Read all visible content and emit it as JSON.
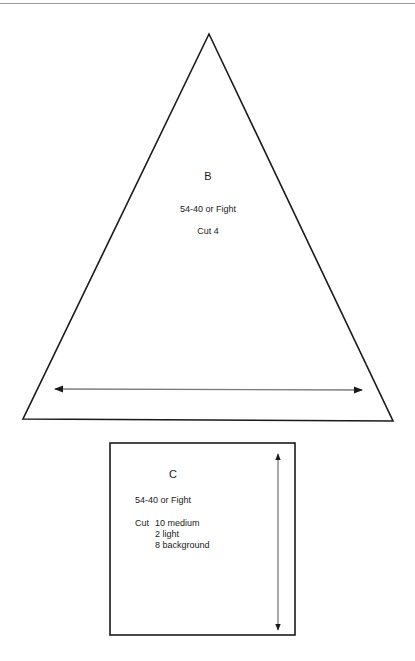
{
  "page": {
    "colors": {
      "outline": "#1a1a1a",
      "grainline": "#7a7a7a",
      "background": "#ffffff"
    }
  },
  "template_b": {
    "letter": "B",
    "block_name": "54-40 or Fight",
    "cut_instruction": "Cut 4",
    "shape": "triangle",
    "grainline": "horizontal-double-arrow"
  },
  "template_c": {
    "letter": "C",
    "block_name": "54-40 or Fight",
    "cut_label": "Cut",
    "cut_items": [
      "10 medium",
      "2 light",
      "8 background"
    ],
    "shape": "square",
    "grainline": "vertical-double-arrow"
  }
}
